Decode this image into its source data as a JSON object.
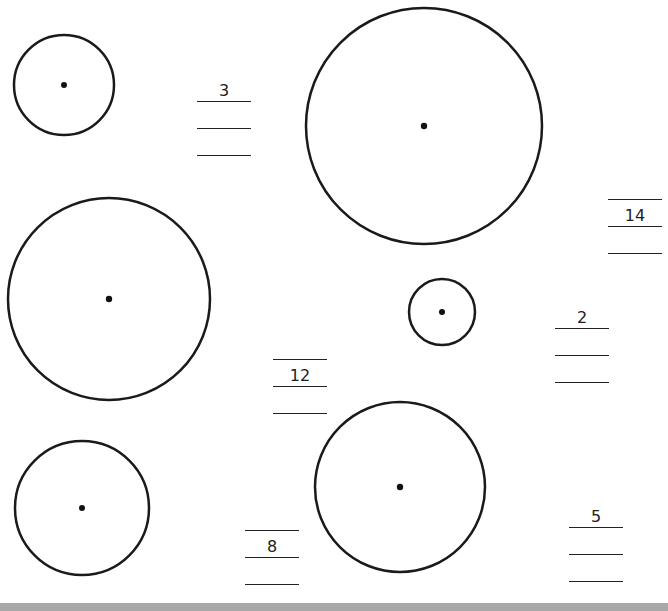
{
  "worksheet": {
    "labels": {
      "radius": "radius",
      "diameter": "diameter",
      "circumference": "circumference"
    },
    "problems": [
      {
        "id": "a",
        "radius": "3",
        "diameter": "",
        "circumference": ""
      },
      {
        "id": "b",
        "radius": "",
        "diameter": "14",
        "circumference": ""
      },
      {
        "id": "c",
        "radius": "",
        "diameter": "12",
        "circumference": ""
      },
      {
        "id": "d",
        "radius": "2",
        "diameter": "",
        "circumference": ""
      },
      {
        "id": "e",
        "radius": "",
        "diameter": "8",
        "circumference": ""
      },
      {
        "id": "f",
        "radius": "5",
        "diameter": "",
        "circumference": ""
      }
    ]
  }
}
